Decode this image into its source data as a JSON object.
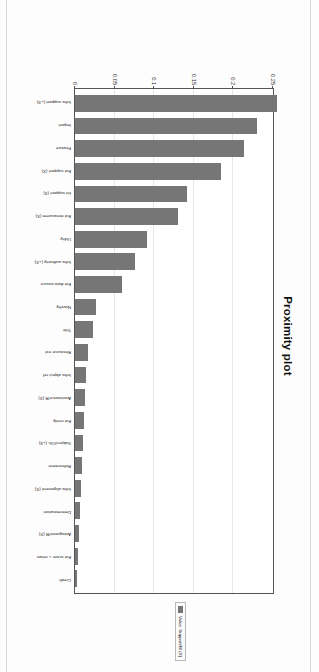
{
  "figure": {
    "title": "Proximity plot",
    "orientation_note": "printed sideways on page",
    "legend": {
      "label": "Value: Support/Bf (X)",
      "swatch_color": "#767676"
    }
  },
  "chart_data": {
    "type": "bar",
    "title": "Proximity plot",
    "xlabel": "",
    "ylabel": "",
    "ylim": [
      0,
      0.25
    ],
    "grid": true,
    "legend_position": "right",
    "bar_color": "#767676",
    "yticks": [
      "0",
      "0.05",
      "0.1",
      "0.15",
      "0.2",
      "0.25"
    ],
    "ytick_values": [
      0,
      0.05,
      0.1,
      0.15,
      0.2,
      0.25
    ],
    "categories": [
      "Infra support (+X)",
      "Import",
      "Feature",
      "Ext support (X)",
      "Int support (X)",
      "Ext measurem (X)",
      "Utility",
      "Infra authority (+X)",
      "Ext data source",
      "Novelty",
      "Title",
      "Resource ext",
      "Infra object ref",
      "Assistance/R (X)",
      "Ext entity",
      "Subject/Ofc (+X)",
      "Refinement",
      "Infra alignment (X)",
      "Determination",
      "Antagonist/R (X)",
      "Ext score + retain",
      "Credit"
    ],
    "values": [
      0.2555,
      0.2295,
      0.2135,
      0.184,
      0.1415,
      0.1295,
      0.0905,
      0.0755,
      0.0595,
      0.0265,
      0.023,
      0.0165,
      0.014,
      0.013,
      0.011,
      0.0095,
      0.0092,
      0.0072,
      0.0058,
      0.005,
      0.0032,
      0.003
    ]
  }
}
